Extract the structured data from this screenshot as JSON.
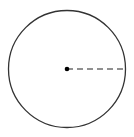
{
  "diagram": {
    "type": "circle-with-radius",
    "circle": {
      "cx": 67,
      "cy": 69,
      "r": 58.5,
      "stroke": "#333333",
      "stroke_width": 1.3,
      "fill": "#ffffff"
    },
    "center_point": {
      "cx": 67,
      "cy": 69,
      "r": 2.3,
      "fill": "#000000"
    },
    "radius_line": {
      "x1": 67,
      "y1": 69,
      "x2": 125.5,
      "y2": 69,
      "stroke": "#222222",
      "stroke_width": 1.2,
      "dash": "6 4",
      "style": "dashed"
    },
    "labels": []
  }
}
